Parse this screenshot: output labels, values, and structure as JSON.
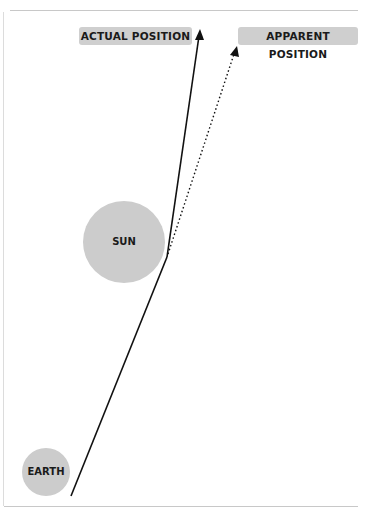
{
  "labels": {
    "actual_position": "ACTUAL POSITION",
    "apparent_position": "APPARENT POSITION"
  },
  "bodies": {
    "sun": "SUN",
    "earth": "EARTH"
  },
  "colors": {
    "body_fill": "#cccccc",
    "label_fill": "#cfcfcf",
    "line": "#111111",
    "frame": "#c8c8c8"
  }
}
